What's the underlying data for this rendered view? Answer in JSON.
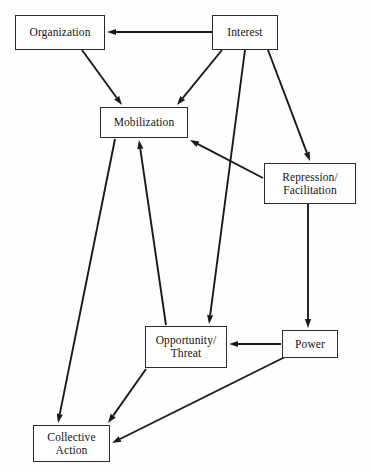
{
  "diagram": {
    "title": "",
    "background_color": "#fefefe",
    "stroke_color": "#1a1a1a",
    "node_fill": "#ffffff",
    "node_border": "#2b2b2b",
    "nodes": [
      {
        "id": "organization",
        "label": "Organization",
        "x": 15,
        "y": 15,
        "w": 90,
        "h": 35
      },
      {
        "id": "interest",
        "label": "Interest",
        "x": 212,
        "y": 15,
        "w": 66,
        "h": 35
      },
      {
        "id": "mobilization",
        "label": "Mobilization",
        "x": 100,
        "y": 107,
        "w": 88,
        "h": 31
      },
      {
        "id": "repression",
        "label": "Repression/\nFacilitation",
        "x": 264,
        "y": 163,
        "w": 92,
        "h": 41
      },
      {
        "id": "opportunity",
        "label": "Opportunity/\nThreat",
        "x": 145,
        "y": 326,
        "w": 82,
        "h": 42
      },
      {
        "id": "power",
        "label": "Power",
        "x": 282,
        "y": 330,
        "w": 56,
        "h": 28
      },
      {
        "id": "collective",
        "label": "Collective\nAction",
        "x": 33,
        "y": 425,
        "w": 77,
        "h": 37
      }
    ],
    "edges": [
      {
        "id": "interest-to-organization",
        "from": "interest",
        "to": "organization",
        "x1": 212,
        "y1": 32,
        "x2": 107,
        "y2": 32,
        "arrow": true
      },
      {
        "id": "organization-to-mobilization",
        "from": "organization",
        "to": "mobilization",
        "x1": 82,
        "y1": 50,
        "x2": 122,
        "y2": 105,
        "arrow": true
      },
      {
        "id": "interest-to-mobilization",
        "from": "interest",
        "to": "mobilization",
        "x1": 222,
        "y1": 50,
        "x2": 177,
        "y2": 105,
        "arrow": true
      },
      {
        "id": "interest-to-opportunity",
        "from": "interest",
        "to": "opportunity",
        "x1": 245,
        "y1": 50,
        "x2": 209,
        "y2": 324,
        "arrow": true
      },
      {
        "id": "interest-to-repression",
        "from": "interest",
        "to": "repression",
        "x1": 268,
        "y1": 50,
        "x2": 310,
        "y2": 161,
        "arrow": true
      },
      {
        "id": "repression-to-mobilization",
        "from": "repression",
        "to": "mobilization",
        "x1": 263,
        "y1": 178,
        "x2": 190,
        "y2": 140,
        "arrow": true
      },
      {
        "id": "repression-to-power",
        "from": "repression",
        "to": "power",
        "x1": 308,
        "y1": 204,
        "x2": 308,
        "y2": 328,
        "arrow": true
      },
      {
        "id": "power-to-opportunity",
        "from": "power",
        "to": "opportunity",
        "x1": 281,
        "y1": 344,
        "x2": 229,
        "y2": 344,
        "arrow": true
      },
      {
        "id": "power-to-collective",
        "from": "power",
        "to": "collective",
        "x1": 285,
        "y1": 357,
        "x2": 112,
        "y2": 443,
        "arrow": true
      },
      {
        "id": "opportunity-to-mobilization",
        "from": "opportunity",
        "to": "mobilization",
        "x1": 166,
        "y1": 325,
        "x2": 139,
        "y2": 140,
        "arrow": true
      },
      {
        "id": "opportunity-to-collective",
        "from": "opportunity",
        "to": "collective",
        "x1": 146,
        "y1": 369,
        "x2": 108,
        "y2": 423,
        "arrow": true
      },
      {
        "id": "mobilization-to-collective",
        "from": "mobilization",
        "to": "collective",
        "x1": 115,
        "y1": 139,
        "x2": 58,
        "y2": 423,
        "arrow": true
      }
    ]
  }
}
